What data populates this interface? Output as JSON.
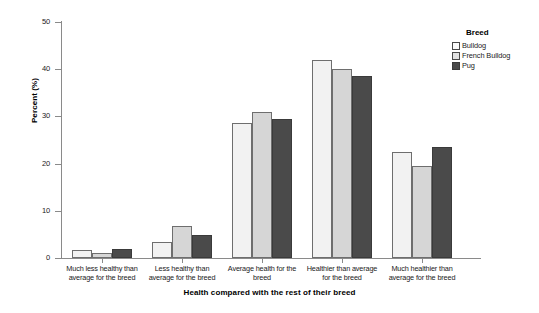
{
  "chart_data": {
    "type": "bar",
    "title": "",
    "xlabel": "Health compared with the rest of their breed",
    "ylabel": "Percent (%)",
    "ylim": [
      0,
      50
    ],
    "yticks": [
      0,
      10,
      20,
      30,
      40,
      50
    ],
    "ytick_labels": [
      "0",
      "10",
      "20",
      "30",
      "40",
      "50"
    ],
    "grid": false,
    "legend_position": "top-right",
    "legend_title": "Breed",
    "categories": [
      "Much less healthy than average for the breed",
      "Less healthy than average for the breed",
      "Average health for the breed",
      "Healthier than average for the breed",
      "Much healthier than average for the breed"
    ],
    "category_lines": [
      [
        "Much less healthy than",
        "average for the breed"
      ],
      [
        "Less healthy than",
        "average for the breed"
      ],
      [
        "Average health for the",
        "breed"
      ],
      [
        "Healthier than average",
        "for the breed"
      ],
      [
        "Much healthier than",
        "average for the breed"
      ]
    ],
    "series": [
      {
        "name": "Bulldog",
        "color": "#f2f2f2",
        "values": [
          1.6,
          3.4,
          28.5,
          42.0,
          22.5
        ]
      },
      {
        "name": "French Bulldog",
        "color": "#d6d6d6",
        "values": [
          1.1,
          6.8,
          31.0,
          40.0,
          19.5
        ]
      },
      {
        "name": "Pug",
        "color": "#4a4a4a",
        "values": [
          1.9,
          4.8,
          29.5,
          38.5,
          23.5
        ]
      }
    ]
  },
  "legend": {
    "title": "Breed",
    "items": [
      {
        "label": "Bulldog"
      },
      {
        "label": "French Bulldog"
      },
      {
        "label": "Pug"
      }
    ]
  },
  "axes": {
    "y_title": "Percent (%)",
    "x_title": "Health compared with the rest of their breed"
  }
}
